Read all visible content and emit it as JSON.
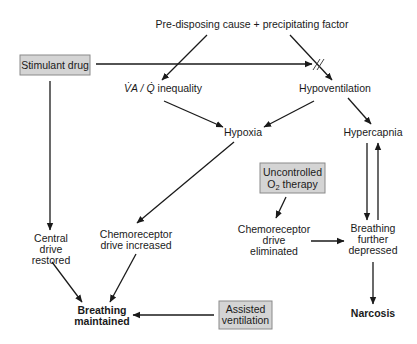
{
  "diagram": {
    "nodes": {
      "cause": {
        "label": "Pre-disposing cause + precipitating factor"
      },
      "stimulant": {
        "label": "Stimulant drug",
        "boxed": true
      },
      "vq": {
        "label_main": "V̇A / Q̇",
        "label_rest": " inequality"
      },
      "hypovent": {
        "label": "Hypoventilation"
      },
      "hypoxia": {
        "label": "Hypoxia"
      },
      "hypercapnia": {
        "label": "Hypercapnia"
      },
      "o2": {
        "line1": "Uncontrolled",
        "line2_pre": "O",
        "line2_sub": "2",
        "line2_post": " therapy",
        "boxed": true
      },
      "central": {
        "line1": "Central",
        "line2": "drive",
        "line3": "restored"
      },
      "chemo_inc": {
        "line1": "Chemoreceptor",
        "line2": "drive increased"
      },
      "chemo_elim": {
        "line1": "Chemoreceptor",
        "line2": "drive",
        "line3": "eliminated"
      },
      "further": {
        "line1": "Breathing",
        "line2": "further",
        "line3": "depressed"
      },
      "maintained": {
        "line1": "Breathing",
        "line2": "maintained"
      },
      "assisted": {
        "line1": "Assisted",
        "line2": "ventilation",
        "boxed": true
      },
      "narcosis": {
        "label": "Narcosis"
      }
    },
    "edges": [
      {
        "from": "cause",
        "to": "vq"
      },
      {
        "from": "cause",
        "to": "hypovent"
      },
      {
        "from": "stimulant",
        "to": "hypovent",
        "style": "blocked"
      },
      {
        "from": "stimulant",
        "to": "central"
      },
      {
        "from": "vq",
        "to": "hypoxia"
      },
      {
        "from": "hypovent",
        "to": "hypoxia"
      },
      {
        "from": "hypovent",
        "to": "hypercapnia"
      },
      {
        "from": "hypoxia",
        "to": "chemo_inc"
      },
      {
        "from": "hypercapnia",
        "to": "further"
      },
      {
        "from": "further",
        "to": "hypercapnia"
      },
      {
        "from": "o2",
        "to": "chemo_elim"
      },
      {
        "from": "chemo_elim",
        "to": "further"
      },
      {
        "from": "further",
        "to": "narcosis"
      },
      {
        "from": "central",
        "to": "maintained"
      },
      {
        "from": "chemo_inc",
        "to": "maintained"
      },
      {
        "from": "assisted",
        "to": "maintained"
      }
    ],
    "colors": {
      "box_fill": "#d4d4d4",
      "box_border": "#8a8a8a",
      "text": "#1a1a1a",
      "background": "#ffffff"
    }
  }
}
